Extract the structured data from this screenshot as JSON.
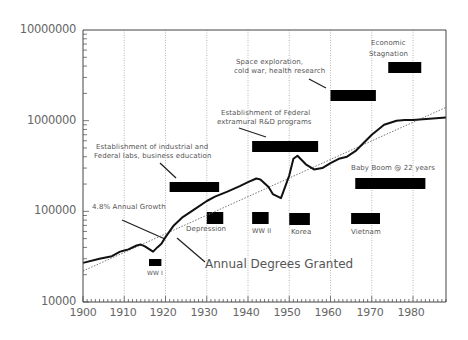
{
  "chart_data": {
    "type": "line",
    "title": "",
    "xlabel": "",
    "ylabel": "",
    "yscale": "log",
    "xlim": [
      1900,
      1988
    ],
    "ylim": [
      10000,
      10000000
    ],
    "grid": {
      "vertical_dotted": true
    },
    "x_ticks": [
      "1900",
      "1910",
      "1920",
      "1930",
      "1940",
      "1950",
      "1960",
      "1970",
      "1980"
    ],
    "y_ticks": [
      "10000",
      "100000",
      "1000000",
      "10000000"
    ],
    "series": [
      {
        "name": "Annual Degrees Granted",
        "style": "solid",
        "x": [
          1900,
          1904,
          1907,
          1909,
          1910,
          1911,
          1913,
          1914,
          1915,
          1917,
          1918,
          1919,
          1920,
          1922,
          1924,
          1927,
          1930,
          1932,
          1935,
          1938,
          1940,
          1942,
          1943,
          1945,
          1946,
          1948,
          1950,
          1951,
          1952,
          1954,
          1956,
          1958,
          1960,
          1962,
          1964,
          1966,
          1970,
          1973,
          1976,
          1978,
          1980,
          1984,
          1988
        ],
        "values": [
          27000,
          30000,
          32000,
          36000,
          37000,
          38000,
          42000,
          43000,
          41000,
          36000,
          40000,
          44000,
          52000,
          70000,
          85000,
          105000,
          130000,
          145000,
          165000,
          190000,
          210000,
          230000,
          225000,
          185000,
          155000,
          140000,
          250000,
          380000,
          410000,
          330000,
          290000,
          300000,
          340000,
          380000,
          400000,
          460000,
          700000,
          900000,
          1000000,
          1020000,
          1020000,
          1050000,
          1080000
        ]
      },
      {
        "name": "4.8% Annual Growth",
        "style": "dotted",
        "x": [
          1900,
          1988
        ],
        "values": [
          22000,
          1400000
        ]
      }
    ],
    "annotations": [
      {
        "text": "4.8% Annual Growth",
        "target": "trend line ~1920"
      },
      {
        "text": "Annual Degrees Granted",
        "target": "data line ~1925"
      },
      {
        "text": "Establishment of industrial and Federal labs, business education",
        "bar": [
          1921,
          1933
        ]
      },
      {
        "text": "Establishment of Federal extramural R&D programs",
        "bar": [
          1941,
          1957
        ]
      },
      {
        "text": "Space exploration, cold war, health research",
        "bar": [
          1960,
          1971
        ]
      },
      {
        "text": "Economic Stagnation",
        "bar": [
          1974,
          1982
        ]
      },
      {
        "text": "Baby Boom @ 22 years",
        "bar": [
          1966,
          1983
        ]
      },
      {
        "text": "WW I",
        "bar": [
          1916,
          1919
        ]
      },
      {
        "text": "Depression",
        "bar": [
          1930,
          1934
        ]
      },
      {
        "text": "WW II",
        "bar": [
          1941,
          1945
        ]
      },
      {
        "text": "Korea",
        "bar": [
          1950,
          1955
        ]
      },
      {
        "text": "Vietnam",
        "bar": [
          1965,
          1972
        ]
      }
    ]
  },
  "labels": {
    "growth": "4.8% Annual Growth",
    "degrees": "Annual Degrees Granted",
    "industrial_1": "Establishment of industrial and",
    "industrial_2": "Federal labs, business education",
    "federal_1": "Establishment of Federal",
    "federal_2": "extramural R&D programs",
    "space_1": "Space exploration,",
    "space_2": "cold war, health research",
    "econ_1": "Economic",
    "econ_2": "Stagnation",
    "baby_boom": "Baby Boom @ 22 years",
    "ww1": "WW I",
    "depression": "Depression",
    "ww2": "WW II",
    "korea": "Korea",
    "vietnam": "Vietnam"
  },
  "colors": {
    "line": "#111111",
    "bars": "#000000",
    "axis": "#555555",
    "grid": "#888888",
    "text": "#555555"
  }
}
